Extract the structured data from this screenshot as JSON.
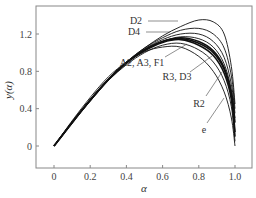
{
  "chart_data": {
    "type": "line",
    "title": "",
    "xlabel": "α",
    "ylabel": "y(α)",
    "xlim": [
      -0.1,
      1.1
    ],
    "ylim": [
      -0.2,
      1.5
    ],
    "xticks": [
      0,
      0.2,
      0.4,
      0.6,
      0.8,
      1.0
    ],
    "xtick_labels": [
      "0",
      "0.2",
      "0.4",
      "0.6",
      "0.8",
      "1.0"
    ],
    "yticks": [
      0,
      0.4,
      0.8,
      1.2
    ],
    "ytick_labels": [
      "0",
      "0.4",
      "0.8",
      "1.2"
    ],
    "grid": false,
    "legend": "inline annotations with leader lines",
    "series": [
      {
        "name": "D2",
        "x": [
          0,
          0.1,
          0.2,
          0.3,
          0.4,
          0.5,
          0.6,
          0.7,
          0.8,
          0.88,
          0.94,
          0.98,
          1.0
        ],
        "y": [
          0,
          0.26,
          0.5,
          0.72,
          0.9,
          1.05,
          1.18,
          1.28,
          1.35,
          1.33,
          1.2,
          0.85,
          0.45
        ]
      },
      {
        "name": "D4",
        "x": [
          0,
          0.1,
          0.2,
          0.3,
          0.4,
          0.5,
          0.6,
          0.7,
          0.8,
          0.88,
          0.94,
          0.98,
          1.0
        ],
        "y": [
          0,
          0.26,
          0.5,
          0.72,
          0.9,
          1.05,
          1.16,
          1.24,
          1.26,
          1.2,
          1.05,
          0.75,
          0.4
        ]
      },
      {
        "name": "D3",
        "x": [
          0,
          0.1,
          0.2,
          0.3,
          0.4,
          0.5,
          0.6,
          0.7,
          0.8,
          0.88,
          0.94,
          0.98,
          1.0
        ],
        "y": [
          0,
          0.25,
          0.49,
          0.71,
          0.89,
          1.04,
          1.14,
          1.2,
          1.2,
          1.12,
          0.95,
          0.66,
          0.35
        ]
      },
      {
        "name": "R3",
        "x": [
          0,
          0.1,
          0.2,
          0.3,
          0.4,
          0.5,
          0.6,
          0.7,
          0.8,
          0.88,
          0.94,
          0.98,
          1.0
        ],
        "y": [
          0,
          0.25,
          0.49,
          0.71,
          0.89,
          1.03,
          1.12,
          1.17,
          1.15,
          1.06,
          0.88,
          0.6,
          0.3
        ]
      },
      {
        "name": "A2",
        "x": [
          0,
          0.1,
          0.2,
          0.3,
          0.4,
          0.5,
          0.6,
          0.7,
          0.8,
          0.88,
          0.94,
          0.98,
          1.0
        ],
        "y": [
          0,
          0.25,
          0.49,
          0.71,
          0.89,
          1.03,
          1.12,
          1.16,
          1.12,
          1.02,
          0.84,
          0.56,
          0.25
        ]
      },
      {
        "name": "A3",
        "x": [
          0,
          0.1,
          0.2,
          0.3,
          0.4,
          0.5,
          0.6,
          0.7,
          0.8,
          0.88,
          0.94,
          0.98,
          1.0
        ],
        "y": [
          0,
          0.25,
          0.49,
          0.71,
          0.89,
          1.03,
          1.12,
          1.15,
          1.1,
          1.0,
          0.82,
          0.54,
          0.15
        ]
      },
      {
        "name": "F1",
        "x": [
          0,
          0.1,
          0.2,
          0.3,
          0.4,
          0.5,
          0.6,
          0.7,
          0.8,
          0.88,
          0.94,
          0.98,
          1.0
        ],
        "y": [
          0,
          0.25,
          0.49,
          0.71,
          0.89,
          1.02,
          1.11,
          1.14,
          1.08,
          0.97,
          0.78,
          0.5,
          0.1
        ]
      },
      {
        "name": "R2",
        "x": [
          0,
          0.1,
          0.2,
          0.3,
          0.4,
          0.5,
          0.6,
          0.7,
          0.8,
          0.88,
          0.94,
          0.98,
          1.0
        ],
        "y": [
          0,
          0.25,
          0.48,
          0.7,
          0.87,
          1.0,
          1.08,
          1.1,
          1.03,
          0.9,
          0.7,
          0.42,
          0.05
        ]
      },
      {
        "name": "e",
        "x": [
          0,
          0.1,
          0.2,
          0.3,
          0.4,
          0.5,
          0.6,
          0.7,
          0.8,
          0.88,
          0.94,
          0.98,
          1.0
        ],
        "y": [
          0,
          0.27,
          0.52,
          0.74,
          0.9,
          1.01,
          1.06,
          1.06,
          0.96,
          0.8,
          0.58,
          0.3,
          0.0
        ]
      }
    ],
    "annotations": [
      {
        "text": "D2",
        "x_px": 136,
        "y_px": 24
      },
      {
        "text": "D4",
        "x_px": 134,
        "y_px": 35
      },
      {
        "text": "A2, A3, F1",
        "x_px": 142,
        "y_px": 66
      },
      {
        "text": "R3, D3",
        "x_px": 177,
        "y_px": 80
      },
      {
        "text": "R2",
        "x_px": 199,
        "y_px": 107
      },
      {
        "text": "e",
        "x_px": 204,
        "y_px": 133
      }
    ]
  }
}
